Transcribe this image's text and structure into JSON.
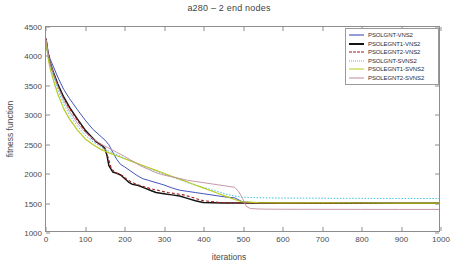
{
  "chart_data": {
    "type": "line",
    "title": "a280 – 2 end nodes",
    "xlabel": "iterations",
    "ylabel": "fitness function",
    "xlim": [
      0,
      1000
    ],
    "ylim": [
      1000,
      4500
    ],
    "xticks": [
      0,
      100,
      200,
      300,
      400,
      500,
      600,
      700,
      800,
      900,
      1000
    ],
    "yticks": [
      1000,
      1500,
      2000,
      2500,
      3000,
      3500,
      4000,
      4500
    ],
    "grid": false,
    "legend_position": "upper-right",
    "series": [
      {
        "name": "PSOLGNT-VNS2",
        "color": "#2b3fb5",
        "style": "solid",
        "width": 0.9,
        "x": [
          0,
          5,
          10,
          20,
          30,
          45,
          60,
          80,
          100,
          120,
          140,
          150,
          160,
          170,
          180,
          190,
          200,
          215,
          230,
          245,
          260,
          280,
          300,
          320,
          340,
          360,
          380,
          400,
          420,
          440,
          460,
          480,
          500,
          520,
          560,
          600,
          700,
          800,
          900,
          1000
        ],
        "y": [
          4300,
          4080,
          3960,
          3800,
          3640,
          3430,
          3270,
          3080,
          2900,
          2740,
          2620,
          2560,
          2480,
          2350,
          2230,
          2140,
          2100,
          2030,
          1960,
          1900,
          1870,
          1830,
          1790,
          1740,
          1700,
          1680,
          1660,
          1640,
          1620,
          1600,
          1580,
          1570,
          1500,
          1490,
          1485,
          1482,
          1480,
          1478,
          1477,
          1476
        ]
      },
      {
        "name": "PSOLEGNT1-VNS2",
        "color": "#141414",
        "style": "solid",
        "width": 1.5,
        "x": [
          0,
          5,
          10,
          20,
          30,
          45,
          60,
          80,
          100,
          115,
          130,
          140,
          150,
          155,
          160,
          170,
          180,
          190,
          200,
          210,
          220,
          235,
          250,
          265,
          280,
          300,
          320,
          340,
          360,
          380,
          400,
          450,
          500,
          600,
          700,
          800,
          900,
          1000
        ],
        "y": [
          4300,
          4050,
          3900,
          3700,
          3520,
          3300,
          3120,
          2920,
          2730,
          2620,
          2520,
          2480,
          2420,
          2300,
          2120,
          2010,
          1990,
          1960,
          1900,
          1840,
          1800,
          1780,
          1740,
          1700,
          1660,
          1640,
          1620,
          1600,
          1560,
          1520,
          1490,
          1482,
          1480,
          1479,
          1478,
          1478,
          1477,
          1477
        ]
      },
      {
        "name": "PSOLEGNT2-VNS2",
        "color": "#a01a1a",
        "style": "dashed",
        "width": 1.1,
        "x": [
          0,
          5,
          10,
          20,
          30,
          45,
          60,
          80,
          100,
          115,
          130,
          140,
          150,
          158,
          165,
          175,
          185,
          195,
          205,
          220,
          235,
          250,
          270,
          290,
          310,
          330,
          350,
          380,
          400,
          440,
          470,
          490,
          500,
          520,
          560,
          600,
          700,
          800,
          900,
          1000
        ],
        "y": [
          4300,
          4030,
          3880,
          3680,
          3500,
          3280,
          3100,
          2900,
          2710,
          2600,
          2510,
          2470,
          2400,
          2260,
          2100,
          2000,
          1980,
          1950,
          1890,
          1830,
          1790,
          1760,
          1720,
          1690,
          1660,
          1640,
          1620,
          1560,
          1520,
          1490,
          1485,
          1483,
          1482,
          1480,
          1479,
          1478,
          1478,
          1477,
          1477,
          1476
        ]
      },
      {
        "name": "PSOLGNT-SVNS2",
        "color": "#3fc2e0",
        "style": "dotted",
        "width": 1.0,
        "x": [
          0,
          5,
          10,
          20,
          30,
          45,
          60,
          80,
          100,
          120,
          140,
          160,
          180,
          200,
          220,
          240,
          260,
          280,
          300,
          320,
          340,
          360,
          380,
          400,
          420,
          440,
          460,
          480,
          500,
          550,
          600,
          700,
          800,
          900,
          1000
        ],
        "y": [
          4280,
          4020,
          3850,
          3620,
          3420,
          3180,
          2990,
          2800,
          2640,
          2530,
          2440,
          2370,
          2310,
          2250,
          2190,
          2130,
          2080,
          2030,
          1980,
          1930,
          1880,
          1830,
          1790,
          1750,
          1710,
          1670,
          1630,
          1600,
          1580,
          1570,
          1565,
          1562,
          1560,
          1559,
          1558
        ]
      },
      {
        "name": "PSOLEGNT1-SVNS2",
        "color": "#b9c91f",
        "style": "solid",
        "width": 1.2,
        "x": [
          0,
          5,
          10,
          20,
          30,
          45,
          60,
          80,
          100,
          120,
          140,
          160,
          180,
          200,
          220,
          240,
          260,
          280,
          300,
          320,
          340,
          360,
          380,
          400,
          420,
          440,
          460,
          480,
          500,
          540,
          600,
          700,
          800,
          900,
          1000
        ],
        "y": [
          4270,
          3980,
          3800,
          3560,
          3350,
          3100,
          2920,
          2730,
          2580,
          2480,
          2400,
          2340,
          2290,
          2240,
          2190,
          2140,
          2090,
          2040,
          1990,
          1940,
          1890,
          1840,
          1790,
          1740,
          1690,
          1640,
          1590,
          1540,
          1500,
          1488,
          1484,
          1481,
          1480,
          1479,
          1478
        ]
      },
      {
        "name": "PSOLEGNT2-SVNS2",
        "color": "#c08a9e",
        "style": "solid",
        "width": 0.9,
        "x": [
          0,
          5,
          10,
          20,
          30,
          45,
          60,
          80,
          100,
          120,
          140,
          160,
          180,
          200,
          220,
          240,
          260,
          280,
          300,
          320,
          340,
          360,
          380,
          400,
          420,
          440,
          460,
          480,
          490,
          500,
          510,
          520,
          540,
          560,
          600,
          700,
          800,
          900,
          1000
        ],
        "y": [
          4290,
          4060,
          3900,
          3680,
          3480,
          3240,
          3050,
          2850,
          2690,
          2580,
          2490,
          2420,
          2350,
          2280,
          2200,
          2120,
          2060,
          2000,
          1960,
          1930,
          1900,
          1870,
          1850,
          1830,
          1810,
          1790,
          1770,
          1750,
          1680,
          1560,
          1420,
          1385,
          1378,
          1375,
          1373,
          1372,
          1371,
          1370,
          1370
        ]
      }
    ]
  },
  "legend": {
    "items": [
      {
        "label": "PSOLGNT-VNS2"
      },
      {
        "label": "PSOLEGNT1-VNS2"
      },
      {
        "label": "PSOLEGNT2-VNS2"
      },
      {
        "label": "PSOLGNT-SVNS2"
      },
      {
        "label": "PSOLEGNT1-SVNS2"
      },
      {
        "label": "PSOLEGNT2-SVNS2"
      }
    ]
  }
}
